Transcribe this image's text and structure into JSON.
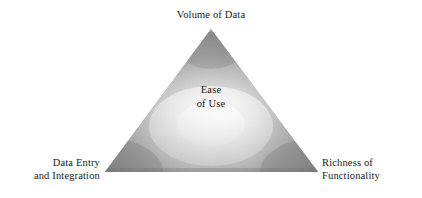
{
  "diagram": {
    "type": "triangle-concept-diagram",
    "background_color": "#ffffff",
    "text_color": "#1a1a1a",
    "title_center": {
      "line1": "Ease",
      "line2": "of Use"
    },
    "vertices": {
      "top": {
        "label": "Volume of Data",
        "position": "apex"
      },
      "bottom_left": {
        "line1": "Data Entry",
        "line2": "and Integration",
        "position": "bottom-left"
      },
      "bottom_right": {
        "line1": "Richness of",
        "line2": "Functionality",
        "position": "bottom-right"
      }
    },
    "shape": {
      "fill_highlight": "#f5f5f5",
      "fill_mid": "#c0c0c0",
      "fill_edge": "#8c8c8c",
      "fill_corner": "#878787",
      "apex_x": 211,
      "apex_y": 29,
      "bottom_left_x": 105,
      "bottom_left_y": 172,
      "bottom_right_x": 318,
      "bottom_right_y": 172
    }
  }
}
